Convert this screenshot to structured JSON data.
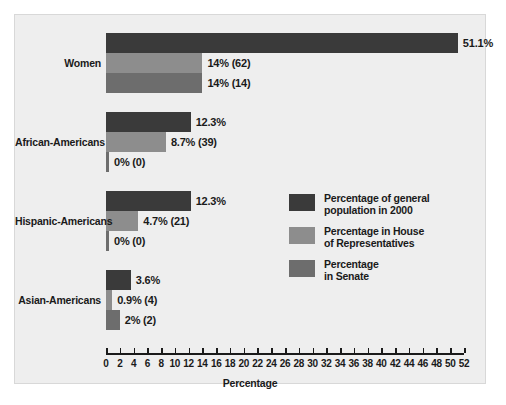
{
  "chart_data": {
    "type": "bar",
    "orientation": "horizontal",
    "title": "",
    "xlabel": "Percentage",
    "ylabel": "",
    "xlim": [
      0,
      52
    ],
    "xticks": [
      0,
      2,
      4,
      6,
      8,
      10,
      12,
      14,
      16,
      18,
      20,
      22,
      24,
      26,
      28,
      30,
      32,
      34,
      36,
      38,
      40,
      42,
      44,
      46,
      48,
      50,
      52
    ],
    "grid": false,
    "legend_position": "center-right",
    "categories": [
      "Women",
      "African-Americans",
      "Hispanic-Americans",
      "Asian-Americans"
    ],
    "series": [
      {
        "name": "Percentage of general\npopulation in 2000",
        "color": "#3a3a3a",
        "values": [
          51.1,
          12.3,
          12.3,
          3.6
        ],
        "labels": [
          "51.1%",
          "12.3%",
          "12.3%",
          "3.6%"
        ]
      },
      {
        "name": "Percentage in House\nof Representatives",
        "color": "#8d8d8d",
        "values": [
          14,
          8.7,
          4.7,
          0.9
        ],
        "labels": [
          "14% (62)",
          "8.7% (39)",
          "4.7% (21)",
          "0.9% (4)"
        ]
      },
      {
        "name": "Percentage\nin Senate",
        "color": "#6d6d6d",
        "values": [
          14,
          0,
          0,
          2
        ],
        "labels": [
          "14% (14)",
          "0% (0)",
          "0% (0)",
          "2% (2)"
        ]
      }
    ]
  },
  "legend": {
    "items": [
      {
        "label": "Percentage of general\npopulation in 2000",
        "color": "#3a3a3a"
      },
      {
        "label": "Percentage in House\nof Representatives",
        "color": "#8d8d8d"
      },
      {
        "label": "Percentage\nin Senate",
        "color": "#6d6d6d"
      }
    ]
  },
  "axis": {
    "title": "Percentage",
    "tick_labels": [
      "0",
      "2",
      "4",
      "6",
      "8",
      "10",
      "12",
      "14",
      "16",
      "18",
      "20",
      "22",
      "24",
      "26",
      "28",
      "30",
      "32",
      "34",
      "36",
      "38",
      "40",
      "42",
      "44",
      "46",
      "48",
      "50",
      "52"
    ]
  }
}
